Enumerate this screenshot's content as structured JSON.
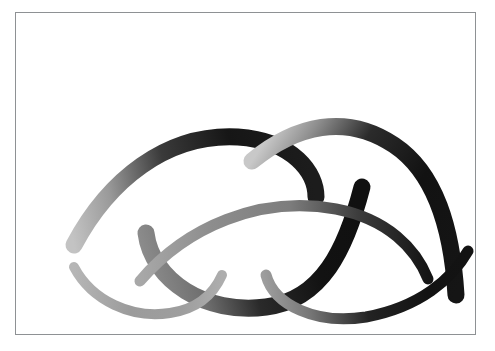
{
  "figure": {
    "canvas": {
      "background_color": "#ffffff",
      "border_color": "#8e9194",
      "border_width_px": 1,
      "outer_width_px": 495,
      "outer_height_px": 351,
      "frame_left_px": 15,
      "frame_top_px": 12,
      "frame_width_px": 461,
      "frame_height_px": 323
    },
    "palette": {
      "lightest_gray": "#b9b9b9",
      "light_gray": "#a3a3a3",
      "mid_gray": "#8a8a8a",
      "dark_gray": "#4a4a4a",
      "near_black": "#1d1d1d",
      "black": "#121212"
    },
    "groups": [
      {
        "name": "upper-wave-group",
        "label": "Upper wave",
        "stroke_count": 3
      },
      {
        "name": "lower-wave-group",
        "label": "Lower wave",
        "stroke_count": 3
      }
    ],
    "strokes": [
      {
        "id": "upper-left-arch",
        "name": "upper-left-arch-stroke",
        "group": "upper-wave-group",
        "shape": "arch-with-descending-hook",
        "path": "M 58 232 C 92 168 150 120 222 124 C 278 128 300 160 300 184",
        "width_px": 17,
        "gradient": {
          "type": "linear",
          "x1": 58,
          "y1": 232,
          "x2": 300,
          "y2": 184,
          "stops": [
            {
              "offset": "0%",
              "color": "#c3c3c3"
            },
            {
              "offset": "18%",
              "color": "#9a9a9a"
            },
            {
              "offset": "42%",
              "color": "#3a3a3a"
            },
            {
              "offset": "70%",
              "color": "#161616"
            },
            {
              "offset": "100%",
              "color": "#1c1c1c"
            }
          ]
        }
      },
      {
        "id": "upper-middle-valley",
        "name": "upper-middle-valley-stroke",
        "group": "upper-wave-group",
        "shape": "valley-rising-right",
        "path": "M 130 220 C 136 268 190 302 250 294 C 306 287 330 236 346 174",
        "width_px": 17,
        "gradient": {
          "type": "linear",
          "x1": 130,
          "y1": 260,
          "x2": 346,
          "y2": 200,
          "stops": [
            {
              "offset": "0%",
              "color": "#8d8d8d"
            },
            {
              "offset": "22%",
              "color": "#6f6f6f"
            },
            {
              "offset": "45%",
              "color": "#2a2a2a"
            },
            {
              "offset": "75%",
              "color": "#121212"
            },
            {
              "offset": "100%",
              "color": "#101010"
            }
          ]
        }
      },
      {
        "id": "upper-right-arch",
        "name": "upper-right-arch-stroke",
        "group": "upper-wave-group",
        "shape": "arch-with-descending-tail",
        "path": "M 236 148 C 280 112 330 100 378 132 C 420 160 436 216 440 282",
        "width_px": 17,
        "gradient": {
          "type": "linear",
          "x1": 236,
          "y1": 148,
          "x2": 440,
          "y2": 282,
          "stops": [
            {
              "offset": "0%",
              "color": "#c8c8c8"
            },
            {
              "offset": "14%",
              "color": "#8e8e8e"
            },
            {
              "offset": "34%",
              "color": "#2b2b2b"
            },
            {
              "offset": "62%",
              "color": "#121212"
            },
            {
              "offset": "100%",
              "color": "#151515"
            }
          ]
        }
      },
      {
        "id": "lower-middle-arch",
        "name": "lower-middle-arch-stroke",
        "group": "lower-wave-group",
        "shape": "broad-arch-descending-right",
        "path": "M 124 268 C 170 214 244 182 320 196 C 372 206 400 236 412 266",
        "width_px": 11,
        "gradient": {
          "type": "linear",
          "x1": 124,
          "y1": 268,
          "x2": 412,
          "y2": 266,
          "stops": [
            {
              "offset": "0%",
              "color": "#a8a8a8"
            },
            {
              "offset": "25%",
              "color": "#8d8d8d"
            },
            {
              "offset": "52%",
              "color": "#7d7d7d"
            },
            {
              "offset": "76%",
              "color": "#3c3c3c"
            },
            {
              "offset": "100%",
              "color": "#141414"
            }
          ]
        }
      },
      {
        "id": "lower-left-valley",
        "name": "lower-left-valley-stroke",
        "group": "lower-wave-group",
        "shape": "shallow-valley",
        "path": "M 58 254 C 76 288 116 306 154 300 C 182 296 198 280 206 262",
        "width_px": 10,
        "gradient": {
          "type": "linear",
          "x1": 58,
          "y1": 254,
          "x2": 206,
          "y2": 262,
          "stops": [
            {
              "offset": "0%",
              "color": "#b6b6b6"
            },
            {
              "offset": "40%",
              "color": "#9b9b9b"
            },
            {
              "offset": "75%",
              "color": "#9e9e9e"
            },
            {
              "offset": "100%",
              "color": "#adadad"
            }
          ]
        }
      },
      {
        "id": "lower-right-valley",
        "name": "lower-right-valley-stroke",
        "group": "lower-wave-group",
        "shape": "valley-rising-right",
        "path": "M 250 262 C 258 292 300 312 350 304 C 404 294 436 266 452 238",
        "width_px": 11,
        "gradient": {
          "type": "linear",
          "x1": 250,
          "y1": 280,
          "x2": 452,
          "y2": 250,
          "stops": [
            {
              "offset": "0%",
              "color": "#9d9d9d"
            },
            {
              "offset": "20%",
              "color": "#767676"
            },
            {
              "offset": "48%",
              "color": "#232323"
            },
            {
              "offset": "78%",
              "color": "#121212"
            },
            {
              "offset": "100%",
              "color": "#131313"
            }
          ]
        }
      }
    ]
  }
}
